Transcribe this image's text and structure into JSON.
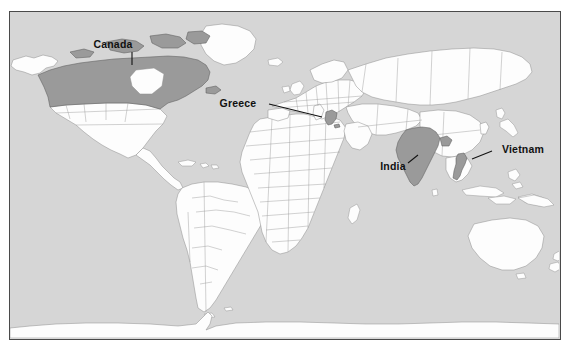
{
  "figure": {
    "type": "world-map",
    "projection": "equirectangular",
    "ocean_color": "#d6d6d6",
    "land_color": "#fdfdfd",
    "border_color": "#9a9a9a",
    "frame_color": "#4a4a4a",
    "highlight_color": "#9a9a9a",
    "label_color": "#111111"
  },
  "highlighted_countries": [
    {
      "name": "Canada",
      "label": "Canada",
      "label_x": 122,
      "label_y": 46,
      "leader": "M131,50 L131,63",
      "region": "North America"
    },
    {
      "name": "Greece",
      "label": "Greece",
      "label_x": 252,
      "label_y": 105,
      "leader": "M268,102 L321,115",
      "region": "Southern Europe"
    },
    {
      "name": "India",
      "label": "India",
      "label_x": 392,
      "label_y": 165,
      "leader": "M407,161 L417,153",
      "region": "South Asia"
    },
    {
      "name": "Vietnam",
      "label": "Vietnam",
      "label_x": 505,
      "label_y": 152,
      "leader": "M471,157 L491,149",
      "region": "Southeast Asia"
    }
  ],
  "labels": {
    "canada": "Canada",
    "greece": "Greece",
    "india": "India",
    "vietnam": "Vietnam"
  }
}
